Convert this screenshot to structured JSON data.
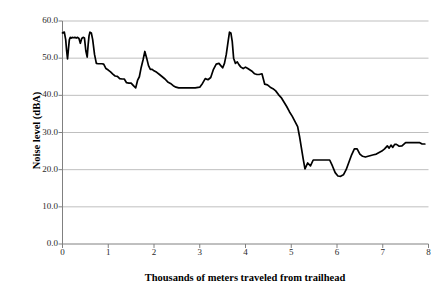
{
  "chart_data": {
    "type": "line",
    "title": "",
    "xlabel": "Thousands of meters traveled from trailhead",
    "ylabel": "Noise level (dBA)",
    "xlim": [
      0,
      8
    ],
    "ylim": [
      0,
      60
    ],
    "xticks": [
      0,
      1,
      2,
      3,
      4,
      5,
      6,
      7,
      8
    ],
    "xtick_labels": [
      "0",
      "1",
      "2",
      "3",
      "4",
      "5",
      "6",
      "7",
      "8"
    ],
    "yticks": [
      0,
      10,
      20,
      30,
      40,
      50,
      60
    ],
    "ytick_labels": [
      "0.0",
      "10.0",
      "20.0",
      "30.0",
      "40.0",
      "50.0",
      "60.0"
    ],
    "grid": "horizontal",
    "legend": "none",
    "line_color": "#000000",
    "grid_color": "#bfbfbf",
    "axis_color": "#808080",
    "series": [
      {
        "name": "Noise level",
        "x": [
          0.0,
          0.04,
          0.07,
          0.09,
          0.11,
          0.13,
          0.15,
          0.17,
          0.19,
          0.21,
          0.24,
          0.27,
          0.3,
          0.33,
          0.36,
          0.39,
          0.42,
          0.45,
          0.48,
          0.51,
          0.54,
          0.56,
          0.58,
          0.6,
          0.63,
          0.66,
          0.7,
          0.74,
          0.78,
          0.82,
          0.86,
          0.9,
          0.95,
          1.0,
          1.05,
          1.1,
          1.15,
          1.2,
          1.25,
          1.3,
          1.35,
          1.4,
          1.45,
          1.5,
          1.55,
          1.6,
          1.64,
          1.68,
          1.72,
          1.76,
          1.8,
          1.84,
          1.88,
          1.92,
          1.96,
          2.0,
          2.06,
          2.12,
          2.18,
          2.24,
          2.3,
          2.36,
          2.42,
          2.48,
          2.54,
          2.6,
          2.7,
          2.8,
          2.9,
          3.0,
          3.06,
          3.12,
          3.18,
          3.24,
          3.3,
          3.36,
          3.42,
          3.46,
          3.5,
          3.54,
          3.58,
          3.62,
          3.65,
          3.68,
          3.71,
          3.74,
          3.78,
          3.82,
          3.86,
          3.9,
          3.95,
          4.0,
          4.05,
          4.1,
          4.15,
          4.2,
          4.25,
          4.3,
          4.36,
          4.42,
          4.48,
          4.54,
          4.6,
          4.66,
          4.72,
          4.78,
          4.84,
          4.9,
          4.96,
          5.02,
          5.08,
          5.14,
          5.18,
          5.22,
          5.26,
          5.3,
          5.36,
          5.42,
          5.48,
          5.54,
          5.6,
          5.66,
          5.72,
          5.78,
          5.84,
          5.9,
          5.96,
          6.02,
          6.08,
          6.14,
          6.2,
          6.26,
          6.32,
          6.38,
          6.44,
          6.5,
          6.56,
          6.62,
          6.68,
          6.74,
          6.8,
          6.86,
          6.92,
          6.98,
          7.04,
          7.1,
          7.14,
          7.18,
          7.22,
          7.26,
          7.3,
          7.36,
          7.42,
          7.5,
          7.58,
          7.66,
          7.74,
          7.8,
          7.86,
          7.92
        ],
        "y": [
          56.8,
          57.0,
          55.0,
          52.0,
          49.8,
          52.5,
          55.0,
          55.6,
          55.4,
          55.6,
          55.5,
          55.6,
          55.4,
          55.6,
          55.3,
          54.0,
          55.3,
          55.6,
          55.4,
          52.0,
          50.3,
          53.5,
          56.0,
          57.0,
          56.8,
          55.0,
          51.0,
          48.6,
          48.5,
          48.5,
          48.5,
          48.4,
          47.2,
          46.8,
          46.3,
          45.7,
          45.2,
          45.1,
          44.5,
          44.4,
          44.4,
          43.4,
          43.3,
          43.3,
          42.6,
          42.0,
          44.0,
          45.0,
          47.5,
          49.5,
          51.8,
          50.0,
          48.0,
          47.0,
          47.0,
          46.6,
          46.2,
          45.6,
          45.0,
          44.4,
          43.6,
          43.2,
          42.6,
          42.2,
          42.0,
          42.0,
          42.0,
          42.0,
          42.0,
          42.2,
          43.2,
          44.5,
          44.2,
          44.8,
          47.0,
          48.4,
          48.6,
          48.0,
          47.4,
          48.6,
          51.0,
          54.5,
          57.0,
          56.8,
          54.5,
          50.0,
          48.6,
          49.0,
          48.2,
          47.6,
          47.2,
          47.6,
          47.2,
          46.8,
          46.4,
          45.8,
          45.6,
          45.6,
          45.8,
          43.0,
          42.8,
          42.2,
          41.8,
          41.2,
          40.2,
          39.4,
          38.2,
          37.0,
          35.6,
          34.4,
          33.0,
          31.6,
          29.0,
          26.0,
          23.0,
          20.2,
          21.8,
          21.0,
          22.6,
          22.6,
          22.6,
          22.6,
          22.6,
          22.6,
          22.6,
          21.0,
          19.2,
          18.3,
          18.2,
          18.6,
          20.0,
          22.0,
          24.0,
          25.6,
          25.6,
          24.2,
          23.6,
          23.4,
          23.6,
          23.8,
          24.0,
          24.2,
          24.6,
          25.0,
          25.6,
          26.4,
          25.8,
          26.6,
          26.0,
          26.8,
          26.8,
          26.3,
          26.4,
          27.3,
          27.3,
          27.3,
          27.3,
          27.3,
          26.9,
          26.9
        ]
      }
    ]
  },
  "axes": {
    "y_title": "Noise level (dBA)",
    "x_title": "Thousands of meters traveled from trailhead"
  }
}
